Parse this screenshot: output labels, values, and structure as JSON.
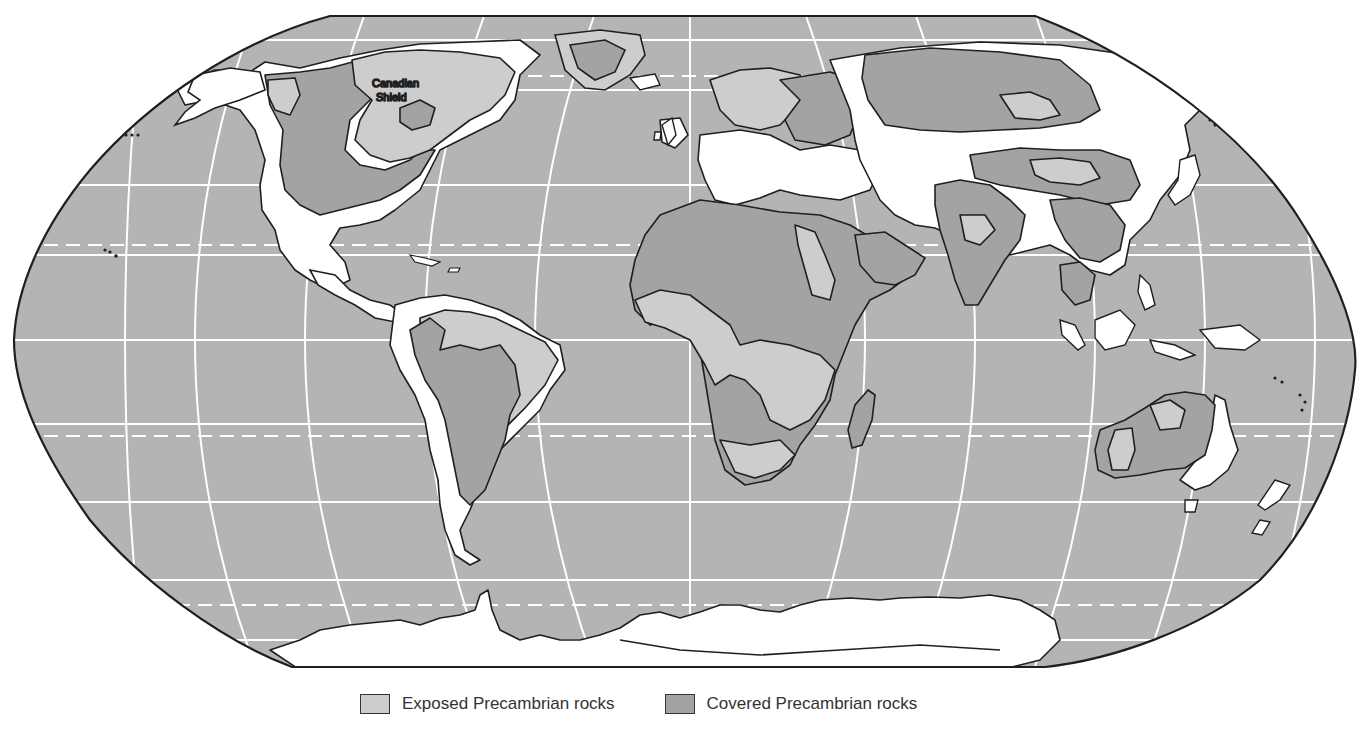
{
  "map": {
    "projection": "Robinson-style world map",
    "labels": {
      "canadian_shield_line1": "Canadian",
      "canadian_shield_line2": "Shield"
    },
    "colors": {
      "ocean": "#b4b4b4",
      "exposed": "#cdcdcd",
      "covered": "#a3a3a3",
      "other_land": "#ffffff",
      "outline": "#1f1f1f",
      "graticule": "#ffffff"
    }
  },
  "legend": {
    "items": [
      {
        "label": "Exposed Precambrian rocks",
        "color": "#cdcdcd"
      },
      {
        "label": "Covered Precambrian rocks",
        "color": "#a3a3a3"
      }
    ]
  }
}
